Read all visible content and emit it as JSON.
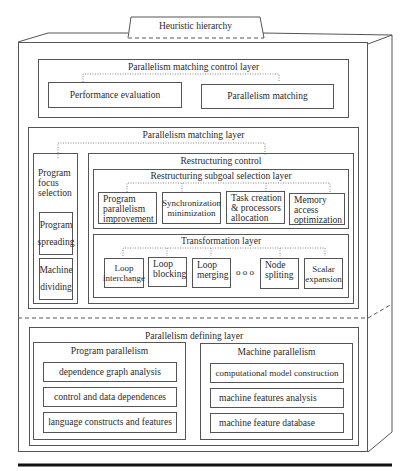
{
  "title_tab": "Heuristic hierarchy",
  "control_layer": {
    "title": "Parallelism matching control layer",
    "items": [
      "Performance evaluation",
      "Parallelism matching"
    ]
  },
  "matching_layer": {
    "title": "Parallelism matching layer",
    "focus": {
      "title": "Program focus selection",
      "title_lines": [
        "Program",
        "focus",
        "selection"
      ],
      "items": [
        {
          "lines": [
            "Program",
            "spreading"
          ]
        },
        {
          "lines": [
            "Machine",
            "dividing"
          ]
        }
      ]
    },
    "restructuring": {
      "title": "Restructuring control",
      "subgoal": {
        "title": "Restructuring subgoal selection layer",
        "items": [
          {
            "lines": [
              "Program",
              "parallelism",
              "improvement"
            ]
          },
          {
            "lines": [
              "Synchronization",
              "minimization"
            ]
          },
          {
            "lines": [
              "Task creation",
              "& processors",
              "allocation"
            ]
          },
          {
            "lines": [
              "Memory",
              "access",
              "optimization"
            ]
          }
        ]
      },
      "transformation": {
        "title": "Transformation layer",
        "items": [
          {
            "lines": [
              "Loop",
              "interchange"
            ]
          },
          {
            "lines": [
              "Loop",
              "blocking"
            ]
          },
          {
            "lines": [
              "Loop",
              "merging"
            ]
          },
          {
            "lines": [
              "Node",
              "spliting"
            ]
          },
          {
            "lines": [
              "Scalar",
              "expansion"
            ]
          }
        ],
        "ellipsis": "o o o"
      }
    }
  },
  "defining_layer": {
    "title": "Parallelism defining layer",
    "program": {
      "title": "Program parallelism",
      "items": [
        "dependence graph analysis",
        "control and data dependences",
        "language constructs and features"
      ]
    },
    "machine": {
      "title": "Machine parallelism",
      "items": [
        "computational model construction",
        "machine features analysis",
        "machine feature database"
      ]
    }
  }
}
